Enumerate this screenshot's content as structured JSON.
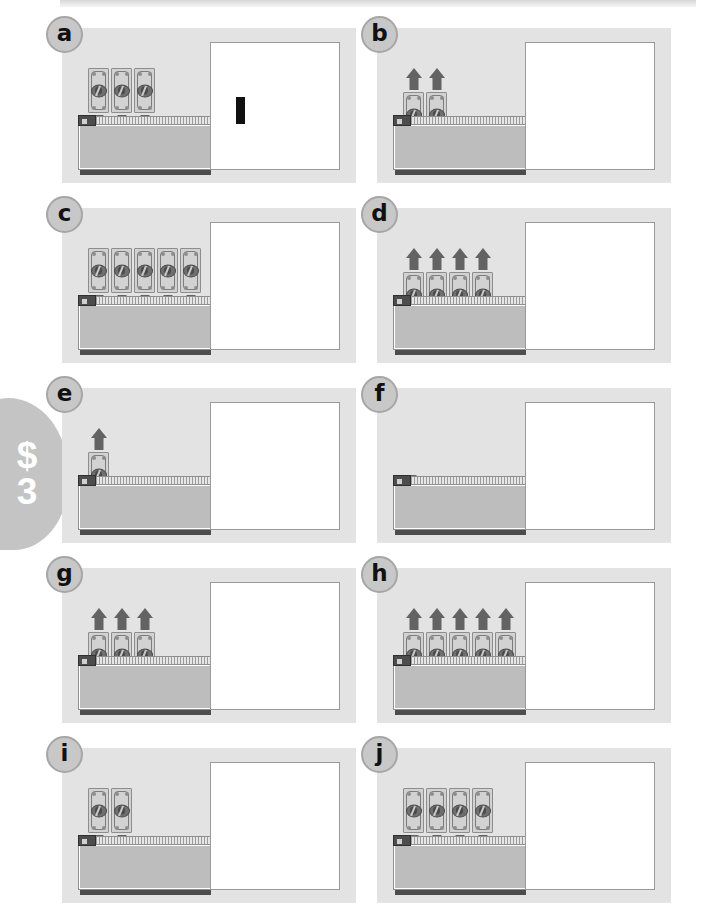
{
  "worksheet": {
    "side_tab": {
      "currency_symbol": "$",
      "number": "3"
    },
    "panel_grid": {
      "columns": 2,
      "rows": 5
    },
    "panels": [
      {
        "id": "a",
        "label": "a",
        "bill_count": 3,
        "arrow_count": 3,
        "direction": "down",
        "answer": "+",
        "answer_symbol_name": "plus-sign"
      },
      {
        "id": "b",
        "label": "b",
        "bill_count": 2,
        "arrow_count": 2,
        "direction": "up",
        "answer": "-",
        "answer_symbol_name": "minus-sign"
      },
      {
        "id": "c",
        "label": "c",
        "bill_count": 5,
        "arrow_count": 5,
        "direction": "down",
        "answer": "",
        "answer_symbol_name": ""
      },
      {
        "id": "d",
        "label": "d",
        "bill_count": 4,
        "arrow_count": 4,
        "direction": "up",
        "answer": "",
        "answer_symbol_name": ""
      },
      {
        "id": "e",
        "label": "e",
        "bill_count": 1,
        "arrow_count": 1,
        "direction": "up",
        "answer": "",
        "answer_symbol_name": ""
      },
      {
        "id": "f",
        "label": "f",
        "bill_count": 0,
        "arrow_count": 1,
        "direction": "down",
        "answer": "",
        "answer_symbol_name": ""
      },
      {
        "id": "g",
        "label": "g",
        "bill_count": 3,
        "arrow_count": 3,
        "direction": "up",
        "answer": "",
        "answer_symbol_name": ""
      },
      {
        "id": "h",
        "label": "h",
        "bill_count": 5,
        "arrow_count": 5,
        "direction": "up",
        "answer": "",
        "answer_symbol_name": ""
      },
      {
        "id": "i",
        "label": "i",
        "bill_count": 2,
        "arrow_count": 2,
        "direction": "down",
        "answer": "",
        "answer_symbol_name": ""
      },
      {
        "id": "j",
        "label": "j",
        "bill_count": 4,
        "arrow_count": 4,
        "direction": "down",
        "answer": "",
        "answer_symbol_name": ""
      }
    ],
    "icon_names": {
      "bill": "dollar-bill-icon",
      "arrow_down": "arrow-down-icon",
      "arrow_up": "arrow-up-icon",
      "pouch": "coin-pouch-icon",
      "badge": "panel-letter-badge"
    },
    "colors": {
      "panel_background": "#e3e3e3",
      "page_background": "#ffffff",
      "arrow": "#636363",
      "bill_fill": "#d2d2d2",
      "pouch_body": "#bdbdbd",
      "answer_box": "#ffffff",
      "symbol": "#111111",
      "side_tab": "#c4c4c4"
    }
  }
}
